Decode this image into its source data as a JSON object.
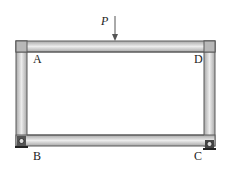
{
  "diagram": {
    "type": "rectangular frame with point load",
    "load": {
      "label": "P",
      "direction": "downward"
    },
    "nodes": [
      {
        "id": "A",
        "label": "A",
        "position": "top-left"
      },
      {
        "id": "D",
        "label": "D",
        "position": "top-right"
      },
      {
        "id": "B",
        "label": "B",
        "position": "bottom-left",
        "support": "pin"
      },
      {
        "id": "C",
        "label": "C",
        "position": "bottom-right",
        "support": "roller"
      }
    ],
    "members": [
      {
        "name": "top-beam",
        "from": "A",
        "to": "D"
      },
      {
        "name": "left-column",
        "from": "A",
        "to": "B"
      },
      {
        "name": "right-column",
        "from": "D",
        "to": "C"
      },
      {
        "name": "bottom-beam",
        "from": "B",
        "to": "C"
      }
    ],
    "colors": {
      "member_fill": "#d4d4d4",
      "member_edge": "#5a5a5a",
      "support": "#333333"
    }
  }
}
